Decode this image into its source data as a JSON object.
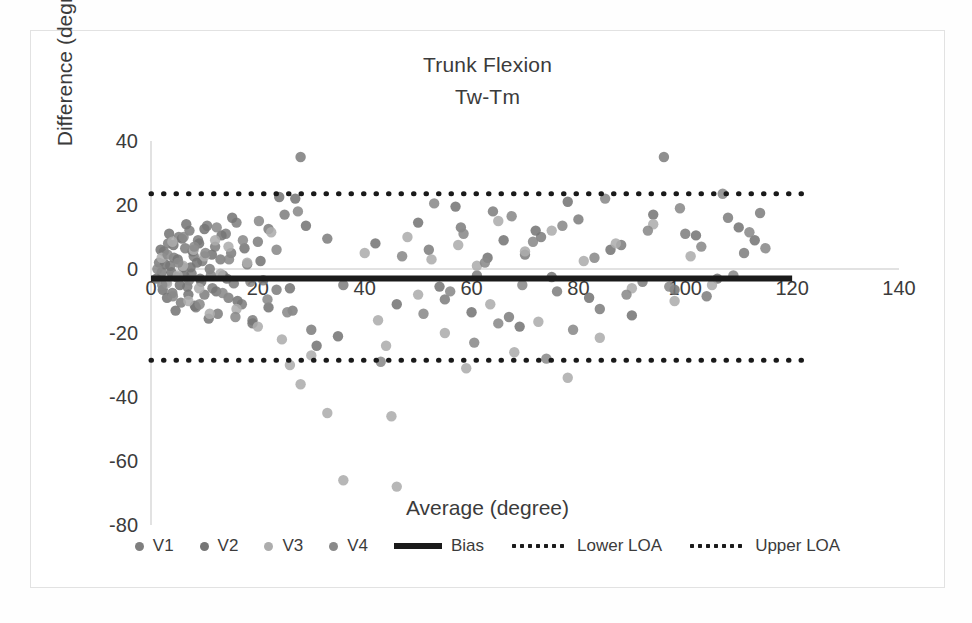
{
  "chart_data": {
    "type": "scatter",
    "title": "Trunk Flexion",
    "subtitle": "Tw-Tm",
    "xlabel": "Average (degree)",
    "ylabel": "Difference (degree)",
    "xlim": [
      0,
      140
    ],
    "ylim": [
      -80,
      40
    ],
    "xticks": [
      "0",
      "20",
      "40",
      "60",
      "80",
      "100",
      "120",
      "140"
    ],
    "yticks": [
      "40",
      "20",
      "0",
      "-20",
      "-40",
      "-60",
      "-80"
    ],
    "xtick_values": [
      0,
      20,
      40,
      60,
      80,
      100,
      120,
      140
    ],
    "ytick_values": [
      40,
      20,
      0,
      -20,
      -40,
      -60,
      -80
    ],
    "grid": false,
    "legend_position": "bottom",
    "reference_lines": [
      {
        "name": "Bias",
        "value": -3.0,
        "style": "solid",
        "color": "#1a1a1a",
        "x_start": 0,
        "x_end": 120
      },
      {
        "name": "Lower LOA",
        "value": -28.5,
        "style": "dotted",
        "color": "#1a1a1a",
        "x_start": 0,
        "x_end": 122
      },
      {
        "name": "Upper LOA",
        "value": 23.5,
        "style": "dotted",
        "color": "#1a1a1a",
        "x_start": 0,
        "x_end": 122
      }
    ],
    "series": [
      {
        "name": "V1",
        "color": "#7f7f7f",
        "points": [
          [
            1.5,
            2.0
          ],
          [
            2.0,
            -1.0
          ],
          [
            2.4,
            5.5
          ],
          [
            2.8,
            -4.0
          ],
          [
            3.2,
            8.0
          ],
          [
            3.6,
            1.0
          ],
          [
            4.0,
            -7.5
          ],
          [
            4.3,
            3.5
          ],
          [
            4.8,
            -2.5
          ],
          [
            5.2,
            10.0
          ],
          [
            5.6,
            -10.5
          ],
          [
            6.0,
            0.5
          ],
          [
            6.4,
            6.5
          ],
          [
            6.8,
            -5.5
          ],
          [
            7.2,
            12.0
          ],
          [
            7.6,
            -1.5
          ],
          [
            8.0,
            4.0
          ],
          [
            8.4,
            -12.0
          ],
          [
            8.8,
            9.0
          ],
          [
            9.2,
            -3.0
          ],
          [
            9.6,
            2.5
          ],
          [
            10.0,
            -8.0
          ],
          [
            10.5,
            13.5
          ],
          [
            11.0,
            0.0
          ],
          [
            11.5,
            -6.0
          ],
          [
            12.0,
            7.0
          ],
          [
            12.5,
            -14.0
          ],
          [
            13.0,
            3.0
          ],
          [
            13.5,
            -2.0
          ],
          [
            14.0,
            11.0
          ],
          [
            14.5,
            -9.0
          ],
          [
            15.0,
            5.0
          ],
          [
            15.5,
            -4.5
          ],
          [
            16.0,
            14.5
          ],
          [
            17.0,
            -11.0
          ],
          [
            18.0,
            1.5
          ],
          [
            19.0,
            -16.0
          ],
          [
            20.0,
            8.5
          ],
          [
            21.0,
            -3.5
          ],
          [
            22.0,
            12.5
          ],
          [
            23.5,
            -6.5
          ],
          [
            25.0,
            17.0
          ],
          [
            26.5,
            -13.0
          ],
          [
            28.0,
            35.0
          ],
          [
            30.0,
            -19.0
          ],
          [
            33.0,
            9.5
          ],
          [
            36.0,
            -5.0
          ],
          [
            52.0,
            6.0
          ],
          [
            55.0,
            -9.5
          ],
          [
            58.0,
            13.0
          ],
          [
            61.0,
            -2.0
          ],
          [
            64.0,
            18.0
          ],
          [
            67.0,
            -15.0
          ],
          [
            70.0,
            4.5
          ],
          [
            73.0,
            10.0
          ],
          [
            76.0,
            -7.0
          ],
          [
            80.0,
            15.5
          ],
          [
            84.0,
            -12.5
          ],
          [
            88.0,
            7.5
          ],
          [
            92.0,
            -4.0
          ],
          [
            96.0,
            35.0
          ],
          [
            100.0,
            11.0
          ],
          [
            104.0,
            -8.5
          ],
          [
            108.0,
            16.0
          ],
          [
            111.0,
            5.0
          ],
          [
            114.0,
            17.5
          ]
        ]
      },
      {
        "name": "V2",
        "color": "#767676",
        "points": [
          [
            1.0,
            -3.0
          ],
          [
            1.8,
            6.0
          ],
          [
            2.2,
            -6.5
          ],
          [
            2.6,
            1.5
          ],
          [
            3.0,
            -9.0
          ],
          [
            3.4,
            11.0
          ],
          [
            3.8,
            -1.0
          ],
          [
            4.2,
            7.5
          ],
          [
            4.6,
            -13.0
          ],
          [
            5.0,
            3.0
          ],
          [
            5.4,
            -5.0
          ],
          [
            5.8,
            9.5
          ],
          [
            6.2,
            -2.0
          ],
          [
            6.6,
            14.0
          ],
          [
            7.0,
            -8.0
          ],
          [
            7.4,
            0.5
          ],
          [
            7.8,
            5.5
          ],
          [
            8.2,
            -11.5
          ],
          [
            8.6,
            2.0
          ],
          [
            9.0,
            8.0
          ],
          [
            9.4,
            -4.0
          ],
          [
            10.0,
            12.5
          ],
          [
            10.8,
            -15.5
          ],
          [
            11.4,
            4.5
          ],
          [
            12.2,
            -7.0
          ],
          [
            13.2,
            10.5
          ],
          [
            14.2,
            -3.0
          ],
          [
            15.2,
            16.0
          ],
          [
            16.2,
            -10.0
          ],
          [
            17.5,
            6.5
          ],
          [
            19.0,
            -17.0
          ],
          [
            20.5,
            2.5
          ],
          [
            22.0,
            -12.0
          ],
          [
            24.0,
            22.5
          ],
          [
            26.0,
            -6.0
          ],
          [
            27.0,
            22.0
          ],
          [
            29.0,
            13.5
          ],
          [
            31.0,
            -24.0
          ],
          [
            35.0,
            -21.0
          ],
          [
            42.0,
            8.0
          ],
          [
            46.0,
            -11.0
          ],
          [
            50.0,
            14.5
          ],
          [
            54.0,
            -5.5
          ],
          [
            57.0,
            19.5
          ],
          [
            60.0,
            -13.5
          ],
          [
            63.0,
            3.5
          ],
          [
            66.0,
            9.0
          ],
          [
            69.0,
            -18.0
          ],
          [
            72.0,
            12.0
          ],
          [
            75.0,
            -2.5
          ],
          [
            78.0,
            21.0
          ],
          [
            82.0,
            -9.0
          ],
          [
            86.0,
            6.0
          ],
          [
            90.0,
            -14.5
          ],
          [
            94.0,
            17.0
          ],
          [
            98.0,
            -6.5
          ],
          [
            102.0,
            10.5
          ],
          [
            106.0,
            -3.0
          ],
          [
            110.0,
            13.0
          ],
          [
            113.0,
            9.0
          ]
        ]
      },
      {
        "name": "V3",
        "color": "#adadad",
        "points": [
          [
            2.0,
            3.5
          ],
          [
            3.0,
            -4.5
          ],
          [
            4.0,
            8.5
          ],
          [
            5.0,
            -2.0
          ],
          [
            6.0,
            1.0
          ],
          [
            7.0,
            -10.0
          ],
          [
            8.0,
            6.0
          ],
          [
            9.0,
            -6.0
          ],
          [
            10.0,
            4.0
          ],
          [
            11.0,
            -14.0
          ],
          [
            12.0,
            9.0
          ],
          [
            13.0,
            -1.5
          ],
          [
            14.5,
            7.0
          ],
          [
            16.0,
            -12.5
          ],
          [
            18.0,
            2.0
          ],
          [
            20.0,
            -18.0
          ],
          [
            22.5,
            11.5
          ],
          [
            24.5,
            -22.0
          ],
          [
            26.0,
            -30.0
          ],
          [
            28.0,
            -36.0
          ],
          [
            30.0,
            -27.0
          ],
          [
            33.0,
            -45.0
          ],
          [
            36.0,
            -66.0
          ],
          [
            40.0,
            5.0
          ],
          [
            42.5,
            -16.0
          ],
          [
            44.0,
            -24.0
          ],
          [
            45.0,
            -46.0
          ],
          [
            46.0,
            -68.0
          ],
          [
            48.0,
            10.0
          ],
          [
            50.0,
            -8.0
          ],
          [
            52.5,
            3.0
          ],
          [
            55.0,
            -20.0
          ],
          [
            57.5,
            7.5
          ],
          [
            59.0,
            -31.0
          ],
          [
            61.0,
            1.0
          ],
          [
            63.5,
            -11.0
          ],
          [
            65.0,
            15.0
          ],
          [
            68.0,
            -26.0
          ],
          [
            70.0,
            5.5
          ],
          [
            72.5,
            -16.5
          ],
          [
            75.0,
            12.0
          ],
          [
            78.0,
            -34.0
          ],
          [
            81.0,
            2.5
          ],
          [
            84.0,
            -21.5
          ],
          [
            87.0,
            8.0
          ],
          [
            90.0,
            -6.0
          ],
          [
            94.0,
            14.0
          ],
          [
            98.0,
            -10.0
          ],
          [
            101.0,
            4.0
          ],
          [
            105.0,
            -5.0
          ]
        ]
      },
      {
        "name": "V4",
        "color": "#8a8a8a",
        "points": [
          [
            1.2,
            0.0
          ],
          [
            2.1,
            -5.0
          ],
          [
            3.1,
            4.5
          ],
          [
            4.1,
            -8.5
          ],
          [
            5.1,
            2.0
          ],
          [
            6.1,
            10.0
          ],
          [
            7.1,
            -3.5
          ],
          [
            8.1,
            7.0
          ],
          [
            9.1,
            -11.0
          ],
          [
            10.2,
            5.0
          ],
          [
            11.2,
            -2.0
          ],
          [
            12.3,
            13.0
          ],
          [
            13.4,
            -7.5
          ],
          [
            14.6,
            3.0
          ],
          [
            15.8,
            -15.0
          ],
          [
            17.2,
            9.0
          ],
          [
            18.6,
            -4.0
          ],
          [
            20.2,
            15.0
          ],
          [
            21.8,
            -9.5
          ],
          [
            23.5,
            6.0
          ],
          [
            25.5,
            -13.5
          ],
          [
            27.5,
            18.0
          ],
          [
            43.0,
            -29.0
          ],
          [
            47.0,
            4.0
          ],
          [
            51.0,
            -14.0
          ],
          [
            53.0,
            20.5
          ],
          [
            56.0,
            -7.0
          ],
          [
            58.5,
            11.0
          ],
          [
            60.5,
            -23.0
          ],
          [
            62.5,
            2.0
          ],
          [
            65.0,
            -17.0
          ],
          [
            67.5,
            16.5
          ],
          [
            69.5,
            -5.0
          ],
          [
            71.5,
            8.5
          ],
          [
            74.0,
            -28.0
          ],
          [
            77.0,
            13.5
          ],
          [
            79.0,
            -19.0
          ],
          [
            83.0,
            3.5
          ],
          [
            85.0,
            22.0
          ],
          [
            89.0,
            -8.0
          ],
          [
            93.0,
            12.0
          ],
          [
            97.0,
            -5.5
          ],
          [
            99.0,
            19.0
          ],
          [
            103.0,
            7.0
          ],
          [
            107.0,
            23.5
          ],
          [
            109.0,
            -2.0
          ],
          [
            112.0,
            11.5
          ],
          [
            115.0,
            6.5
          ]
        ]
      }
    ]
  },
  "legend": {
    "items": [
      {
        "label": "V1",
        "type": "dot",
        "color": "#7f7f7f"
      },
      {
        "label": "V2",
        "type": "dot",
        "color": "#767676"
      },
      {
        "label": "V3",
        "type": "dot",
        "color": "#adadad"
      },
      {
        "label": "V4",
        "type": "dot",
        "color": "#8a8a8a"
      },
      {
        "label": "Bias",
        "type": "solid",
        "color": "#1a1a1a"
      },
      {
        "label": "Lower LOA",
        "type": "dotted",
        "color": "#1a1a1a"
      },
      {
        "label": "Upper LOA",
        "type": "dotted",
        "color": "#1a1a1a"
      }
    ]
  }
}
